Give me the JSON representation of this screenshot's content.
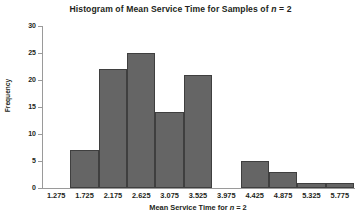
{
  "chart_data": {
    "type": "bar",
    "title": "Histogram of Mean Service Time for Samples of n = 2",
    "title_parts": {
      "before": "Histogram of Mean Service Time for Samples of ",
      "italic": "n",
      "after": " = 2"
    },
    "xlabel": "Mean Service Time for n = 2",
    "xlabel_parts": {
      "before": "Mean Service Time for ",
      "italic": "n",
      "after": " = 2"
    },
    "ylabel": "Frequency",
    "categories": [
      "1.275",
      "1.725",
      "2.175",
      "2.625",
      "3.075",
      "3.525",
      "3.975",
      "4.425",
      "4.875",
      "5.325",
      "5.775"
    ],
    "values": [
      0,
      7,
      22,
      25,
      14,
      21,
      0,
      5,
      3,
      1,
      1
    ],
    "ylim": [
      0,
      30
    ],
    "yticks": [
      0,
      5,
      10,
      15,
      20,
      25,
      30
    ],
    "ytick_labels": [
      "0",
      "5",
      "10",
      "15",
      "20",
      "25",
      "30"
    ],
    "grid": false,
    "legend": false,
    "bar_color": "#656565",
    "bar_edge_color": "#3f3f3f",
    "axis_color": "#9a9a9a",
    "text_color": "#231f20"
  }
}
